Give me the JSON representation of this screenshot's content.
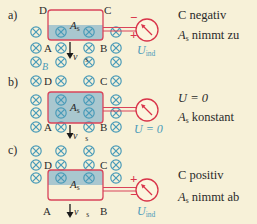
{
  "colors": {
    "background": "#f7f1d8",
    "loop_stroke": "#d9445a",
    "shaded_area": "#a9c7cf",
    "field_symbol": "#4a9bb8",
    "meter": "#d9344a",
    "text": "#2a2a2a"
  },
  "field_symbol": "⊗",
  "field_symbol_name": "magnetic-field-into-page-icon",
  "panels": [
    {
      "id": "a",
      "label": "a)",
      "corners": {
        "A": "A",
        "B": "B",
        "C": "C",
        "D": "D"
      },
      "area_label": "A",
      "area_sub": "s",
      "velocity_label": "v",
      "velocity_sub": "s",
      "field_label": "B",
      "meter_top_sign": "−",
      "meter_bottom_sign": "+",
      "meter_label": "U",
      "meter_label_sub": "ind",
      "side_line1": "C  negativ",
      "side_line2_var": "A",
      "side_line2_sub": "s",
      "side_line2_text": " nimmt zu"
    },
    {
      "id": "b",
      "label": "b)",
      "corners": {
        "A": "A",
        "B": "B",
        "C": "C",
        "D": "D"
      },
      "area_label": "A",
      "area_sub": "s",
      "velocity_label": "v",
      "velocity_sub": "s",
      "meter_label": "U = 0",
      "side_line1": "U = 0",
      "side_line2_var": "A",
      "side_line2_sub": "s",
      "side_line2_text": " konstant"
    },
    {
      "id": "c",
      "label": "c)",
      "corners": {
        "A": "A",
        "B": "B",
        "C": "C",
        "D": "D"
      },
      "area_label": "A",
      "area_sub": "s",
      "velocity_label": "v",
      "velocity_sub": "s",
      "meter_top_sign": "+",
      "meter_bottom_sign": "−",
      "meter_label": "U",
      "meter_label_sub": "ind",
      "side_line1": "C positiv",
      "side_line2_var": "A",
      "side_line2_sub": "s",
      "side_line2_text": " nimmt ab"
    }
  ]
}
